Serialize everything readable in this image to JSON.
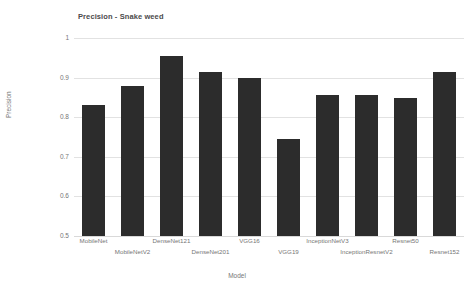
{
  "chart_data": {
    "type": "bar",
    "title": "Precision - Snake weed",
    "xlabel": "Model",
    "ylabel": "Precision",
    "ylim": [
      0.5,
      1
    ],
    "yticks": [
      "0.5",
      "0.6",
      "0.7",
      "0.8",
      "0.9",
      "1"
    ],
    "ytick_values": [
      0.5,
      0.6,
      0.7,
      0.8,
      0.9,
      1.0
    ],
    "grid": true,
    "legend": "none",
    "bar_color": "#2c2c2c",
    "categories": [
      "MobileNet",
      "MobileNetV2",
      "DenseNet121",
      "DenseNet201",
      "VGG16",
      "VGG19",
      "InceptionNetV3",
      "InceptionResnetV2",
      "Resnet50",
      "Resnet152"
    ],
    "values": [
      0.83,
      0.88,
      0.955,
      0.915,
      0.9,
      0.745,
      0.855,
      0.855,
      0.848,
      0.915
    ]
  }
}
